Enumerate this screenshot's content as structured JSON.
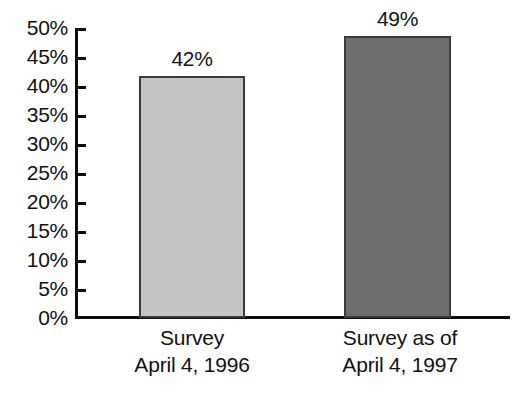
{
  "chart_data": {
    "type": "bar",
    "title": "",
    "subtitle": "",
    "xlabel": "",
    "ylabel": "",
    "categories": [
      "Survey\nApril 4, 1996",
      "Survey as of\nApril 4, 1997"
    ],
    "category_lines": [
      [
        "Survey",
        "April 4, 1996"
      ],
      [
        "Survey as of",
        "April 4, 1997"
      ]
    ],
    "values": [
      42,
      49
    ],
    "value_labels": [
      "42%",
      "49%"
    ],
    "ylim": [
      0,
      50
    ],
    "ytick_values": [
      50,
      45,
      40,
      35,
      30,
      25,
      20,
      15,
      10,
      5,
      0
    ],
    "ytick_labels": [
      "50%",
      "45%",
      "40%",
      "35%",
      "30%",
      "25%",
      "20%",
      "15%",
      "10%",
      "5%",
      "0%"
    ],
    "grid": false,
    "legend": false,
    "legend_position": "none",
    "bar_colors": [
      "#c4c4c4",
      "#6e6e6e"
    ],
    "bar_border_color": "#3a3a3a",
    "axis_color": "#0d0d0d",
    "background_color": "#ffffff",
    "text_color": "#111111"
  }
}
